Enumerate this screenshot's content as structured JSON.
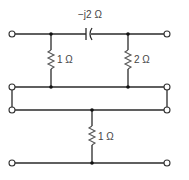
{
  "diagram": {
    "type": "circuit",
    "components": {
      "capacitor": {
        "label": "−j2 Ω",
        "type": "capacitor"
      },
      "resistor_left": {
        "label": "1 Ω",
        "type": "resistor"
      },
      "resistor_right": {
        "label": "2 Ω",
        "type": "resistor"
      },
      "resistor_bottom": {
        "label": "1 Ω",
        "type": "resistor"
      }
    },
    "terminals": 8
  }
}
